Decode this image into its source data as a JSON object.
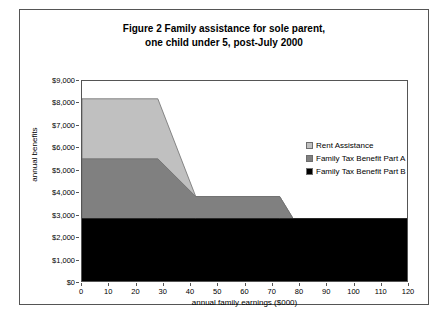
{
  "chart_data": {
    "type": "area",
    "title": "Figure 2   Family assistance for sole parent, one child under 5, post-July 2000",
    "title_lines": [
      "Figure 2   Family assistance for sole parent,",
      "one child under 5, post-July 2000"
    ],
    "xlabel": "annual family earnings ($000)",
    "ylabel": "annual benefits",
    "xlim": [
      0,
      120
    ],
    "ylim": [
      0,
      9000
    ],
    "xticks": [
      0,
      10,
      20,
      30,
      40,
      50,
      60,
      70,
      80,
      90,
      100,
      110,
      120
    ],
    "xtick_labels": [
      "0",
      "10",
      "20",
      "30",
      "40",
      "50",
      "60",
      "70",
      "80",
      "90",
      "100",
      "110",
      "120"
    ],
    "yticks": [
      0,
      1000,
      2000,
      3000,
      4000,
      5000,
      6000,
      7000,
      8000,
      9000
    ],
    "ytick_labels": [
      "$0",
      "$1,000",
      "$2,000",
      "$3,000",
      "$4,000",
      "$5,000",
      "$6,000",
      "$7,000",
      "$8,000",
      "$9,000"
    ],
    "grid": false,
    "stacked": true,
    "legend_position": "inside-right",
    "x": [
      0,
      28,
      42,
      73,
      78,
      120
    ],
    "series": [
      {
        "name": "Family Tax Benefit Part B",
        "color": "#000000",
        "values": [
          2800,
          2800,
          2800,
          2800,
          2800,
          2800
        ]
      },
      {
        "name": "Family Tax Benefit Part A",
        "color": "#808080",
        "values": [
          2700,
          2700,
          1000,
          1000,
          0,
          0
        ]
      },
      {
        "name": "Rent Assistance",
        "color": "#c0c0c0",
        "values": [
          2700,
          2700,
          0,
          0,
          0,
          0
        ]
      }
    ],
    "cumulative_tops": {
      "part_b": [
        2800,
        2800,
        2800,
        2800,
        2800,
        2800
      ],
      "part_a": [
        5500,
        5500,
        3800,
        3800,
        2800,
        2800
      ],
      "rent_assistance": [
        8200,
        8200,
        3800,
        3800,
        2800,
        2800
      ]
    },
    "colors": {
      "rent_assistance": "#c0c0c0",
      "family_tax_benefit_part_a": "#808080",
      "family_tax_benefit_part_b": "#000000",
      "axis": "#555555",
      "plot_background": "#ffffff",
      "figure_background": "#ffffff"
    }
  },
  "legend": {
    "items": [
      {
        "label": "Rent Assistance",
        "color": "#c0c0c0"
      },
      {
        "label": "Family Tax Benefit Part A",
        "color": "#808080"
      },
      {
        "label": "Family Tax Benefit Part B",
        "color": "#000000"
      }
    ]
  }
}
